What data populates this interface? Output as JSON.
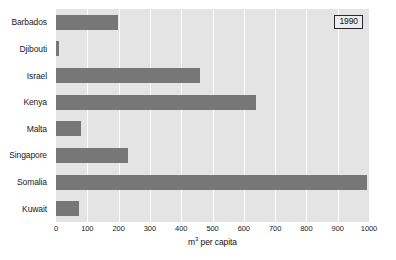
{
  "legend": {
    "label": "1990"
  },
  "axis": {
    "x_title_prefix": "m",
    "x_title_sup": "3",
    "x_title_suffix": " per capita",
    "ticks": [
      "0",
      "100",
      "200",
      "300",
      "400",
      "500",
      "600",
      "700",
      "800",
      "900",
      "1000"
    ]
  },
  "colors": {
    "bar": "#777777",
    "plot_background": "#e4e4e4",
    "gridline": "#fbfbfb",
    "page_background": "#ffffff",
    "text": "#1a1a1a"
  },
  "chart_data": {
    "type": "bar",
    "orientation": "horizontal",
    "title": "",
    "subtitle": "",
    "xlabel": "m3 per capita",
    "ylabel": "",
    "xlim": [
      0,
      1000
    ],
    "grid": true,
    "gridlines": "vertical",
    "legend_position": "top-right",
    "legend_entries": [
      "1990"
    ],
    "categories": [
      "Barbados",
      "Djibouti",
      "Israel",
      "Kenya",
      "Malta",
      "Singapore",
      "Somalia",
      "Kuwait"
    ],
    "values": [
      198,
      10,
      460,
      639,
      80,
      230,
      994,
      74
    ],
    "tick_labels": [
      "0",
      "100",
      "200",
      "300",
      "400",
      "500",
      "600",
      "700",
      "800",
      "900",
      "1000"
    ],
    "tick_values": [
      0,
      100,
      200,
      300,
      400,
      500,
      600,
      700,
      800,
      900,
      1000
    ],
    "series": [
      {
        "name": "1990",
        "values": [
          198,
          10,
          460,
          639,
          80,
          230,
          994,
          74
        ]
      }
    ]
  }
}
